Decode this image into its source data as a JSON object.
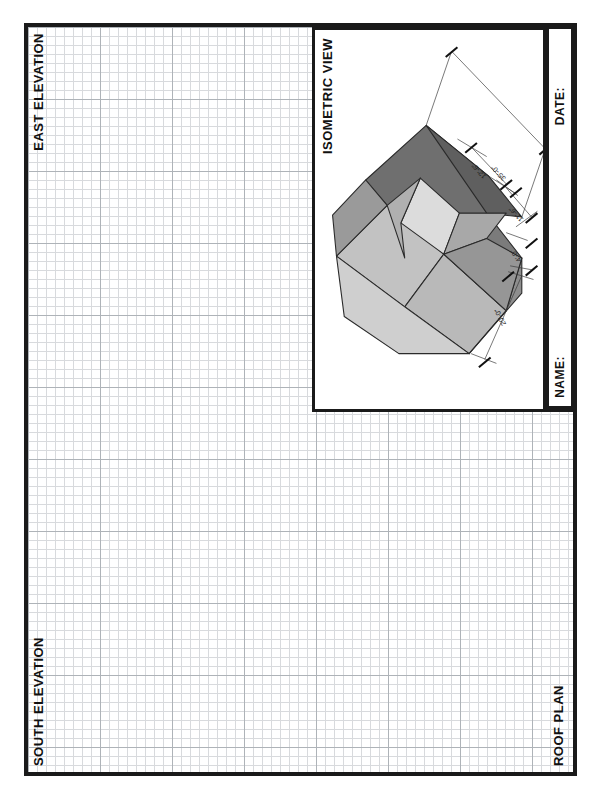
{
  "sheet": {
    "title": "Architectural Drawing Sheet",
    "background_color": "#ffffff",
    "border_color": "#1a1a1a",
    "grid_color": "#9aa0a8"
  },
  "panels": {
    "east_elevation": {
      "label": "EAST ELEVATION"
    },
    "south_elevation": {
      "label": "SOUTH ELEVATION"
    },
    "roof_plan": {
      "label": "ROOF PLAN"
    },
    "isometric": {
      "label": "ISOMETRIC VIEW"
    }
  },
  "title_block": {
    "date_label": "DATE:",
    "date_value": "",
    "name_label": "NAME:",
    "name_value": ""
  },
  "isometric_model": {
    "description": "L-shaped hip-roof massing model shown in isometric projection",
    "face_colors": {
      "top_dark": "#6f6f6f",
      "upper_slope": "#8a8a8a",
      "left_slope": "#9c9c9c",
      "front_light": "#b4b4b4",
      "lower_light": "#c6c6c6",
      "inner_notch": "#d8d8d8",
      "edge": "#2a2a2a"
    },
    "dimensions": [
      {
        "id": "overall-length",
        "text": "35'-0\""
      },
      {
        "id": "wing-depth",
        "text": "12'-6\""
      },
      {
        "id": "wing-width",
        "text": "11'-6\""
      },
      {
        "id": "notch-offset",
        "text": "4'-0\""
      },
      {
        "id": "overall-width",
        "text": "20'-0\""
      }
    ]
  }
}
